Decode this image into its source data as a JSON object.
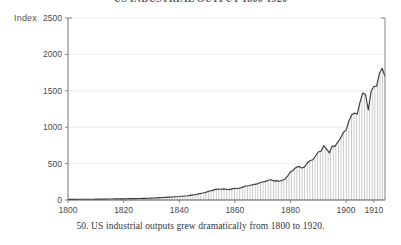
{
  "figure": {
    "title": "US INDUSTRIAL OUTPUT 1800-1920",
    "caption": "50. US industrial outputs grew dramatically from 1800 to 1920.",
    "axis_label": "Index",
    "colors": {
      "line": "#3c3c3c",
      "grid": "#e8e8e8",
      "axis": "#777777",
      "hatch": "#9a9a9a",
      "text": "#4a4a4a",
      "background": "#ffffff"
    }
  },
  "chart_data": {
    "type": "area",
    "title": "US INDUSTRIAL OUTPUT 1800-1920",
    "xlabel": "",
    "ylabel": "Index",
    "xlim": [
      1800,
      1914
    ],
    "ylim": [
      0,
      2500
    ],
    "grid": true,
    "legend": null,
    "xticks": [
      1800,
      1820,
      1840,
      1860,
      1880,
      1900,
      1910
    ],
    "xtick_labels": [
      "1800",
      "1820",
      "1840",
      "1860",
      "1880",
      "1900",
      "1910"
    ],
    "yticks": [
      0,
      500,
      1000,
      1500,
      2000,
      2500
    ],
    "ytick_labels": [
      "0",
      "500",
      "1000",
      "1500",
      "2000",
      "2500"
    ],
    "series": [
      {
        "name": "US industrial output index",
        "x": [
          1800,
          1801,
          1802,
          1803,
          1804,
          1805,
          1806,
          1807,
          1808,
          1809,
          1810,
          1811,
          1812,
          1813,
          1814,
          1815,
          1816,
          1817,
          1818,
          1819,
          1820,
          1821,
          1822,
          1823,
          1824,
          1825,
          1826,
          1827,
          1828,
          1829,
          1830,
          1831,
          1832,
          1833,
          1834,
          1835,
          1836,
          1837,
          1838,
          1839,
          1840,
          1841,
          1842,
          1843,
          1844,
          1845,
          1846,
          1847,
          1848,
          1849,
          1850,
          1851,
          1852,
          1853,
          1854,
          1855,
          1856,
          1857,
          1858,
          1859,
          1860,
          1861,
          1862,
          1863,
          1864,
          1865,
          1866,
          1867,
          1868,
          1869,
          1870,
          1871,
          1872,
          1873,
          1874,
          1875,
          1876,
          1877,
          1878,
          1879,
          1880,
          1881,
          1882,
          1883,
          1884,
          1885,
          1886,
          1887,
          1888,
          1889,
          1890,
          1891,
          1892,
          1893,
          1894,
          1895,
          1896,
          1897,
          1898,
          1899,
          1900,
          1901,
          1902,
          1903,
          1904,
          1905,
          1906,
          1907,
          1908,
          1909,
          1910,
          1911,
          1912,
          1913,
          1914
        ],
        "values": [
          8,
          8,
          9,
          9,
          10,
          10,
          11,
          11,
          10,
          11,
          12,
          12,
          12,
          13,
          13,
          14,
          14,
          15,
          15,
          16,
          16,
          17,
          18,
          18,
          19,
          20,
          21,
          22,
          23,
          24,
          26,
          28,
          30,
          32,
          34,
          37,
          40,
          40,
          42,
          45,
          48,
          52,
          55,
          58,
          64,
          70,
          76,
          84,
          92,
          100,
          112,
          124,
          132,
          146,
          150,
          148,
          152,
          148,
          142,
          152,
          160,
          158,
          166,
          180,
          192,
          196,
          206,
          214,
          222,
          236,
          248,
          256,
          272,
          278,
          262,
          266,
          258,
          272,
          286,
          330,
          386,
          412,
          448,
          462,
          440,
          452,
          508,
          540,
          552,
          604,
          660,
          672,
          746,
          700,
          648,
          742,
          736,
          796,
          848,
          928,
          960,
          1084,
          1168,
          1196,
          1178,
          1340,
          1470,
          1448,
          1236,
          1494,
          1560,
          1564,
          1740,
          1810,
          1700
        ]
      }
    ],
    "peak": {
      "year": 1913,
      "value": 1810
    }
  }
}
